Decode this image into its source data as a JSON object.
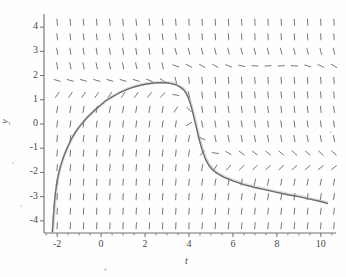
{
  "figure": {
    "name": "slope-field-with-solution-curve",
    "background": "#fefefe",
    "axis_color": "#6e6e6e",
    "field_color": "#777777",
    "curve_color": "#5a5a5a"
  },
  "axes": {
    "x_label": "t",
    "y_label": "y",
    "x_ticks": [
      "-2",
      "0",
      "2",
      "4",
      "6",
      "8",
      "10"
    ],
    "x_tick_values": [
      -2,
      0,
      2,
      4,
      6,
      8,
      10
    ],
    "y_ticks": [
      "4",
      "3",
      "2",
      "1",
      "0",
      "-1",
      "-2",
      "-3",
      "-4"
    ],
    "y_tick_values": [
      4,
      3,
      2,
      1,
      0,
      -1,
      -2,
      -3,
      -4
    ],
    "x_minor_step": 0.5,
    "x_range": [
      -2.6,
      10.6
    ],
    "y_range": [
      -4.5,
      4.5
    ]
  },
  "chart_data": {
    "type": "line",
    "title": "",
    "xlabel": "t",
    "ylabel": "y",
    "xlim": [
      -2.6,
      10.6
    ],
    "ylim": [
      -4.5,
      4.5
    ],
    "grid": false,
    "legend": "none",
    "series": [
      {
        "name": "solution-curve",
        "color": "#5a5a5a",
        "x": [
          -2.22,
          -2.2,
          -2.18,
          -2.15,
          -2.12,
          -2.08,
          -2.02,
          -1.95,
          -1.86,
          -1.75,
          -1.62,
          -1.5,
          -1.35,
          -1.2,
          -1.0,
          -0.8,
          -0.6,
          -0.35,
          -0.1,
          0.2,
          0.5,
          0.8,
          1.1,
          1.4,
          1.7,
          2.0,
          2.3,
          2.6,
          2.9,
          3.15,
          3.4,
          3.6,
          3.75,
          3.85,
          3.95,
          4.05,
          4.15,
          4.25,
          4.35,
          4.45,
          4.6,
          4.75,
          4.9,
          5.1,
          5.3,
          5.6,
          6.0,
          6.5,
          7.0,
          7.5,
          8.0,
          8.5,
          9.0,
          9.5,
          10.0,
          10.3
        ],
        "y": [
          -4.45,
          -4.2,
          -3.9,
          -3.55,
          -3.2,
          -2.85,
          -2.45,
          -2.1,
          -1.78,
          -1.45,
          -1.15,
          -0.9,
          -0.62,
          -0.38,
          -0.12,
          0.1,
          0.3,
          0.52,
          0.72,
          0.95,
          1.12,
          1.27,
          1.4,
          1.5,
          1.58,
          1.64,
          1.68,
          1.7,
          1.7,
          1.68,
          1.62,
          1.52,
          1.42,
          1.3,
          1.12,
          0.88,
          0.55,
          0.18,
          -0.2,
          -0.6,
          -1.08,
          -1.45,
          -1.7,
          -1.92,
          -2.05,
          -2.2,
          -2.35,
          -2.5,
          -2.62,
          -2.72,
          -2.82,
          -2.92,
          -3.0,
          -3.1,
          -3.2,
          -3.28
        ]
      }
    ],
    "slope_field": {
      "description": "short dash segments on a regular grid showing direction field of dy/dt",
      "x_start": -2.0,
      "x_step": 0.6,
      "x_count": 22,
      "y_start": -4.2,
      "y_step": 0.6,
      "y_count": 15,
      "dash_length": 7,
      "color": "#777777"
    }
  }
}
